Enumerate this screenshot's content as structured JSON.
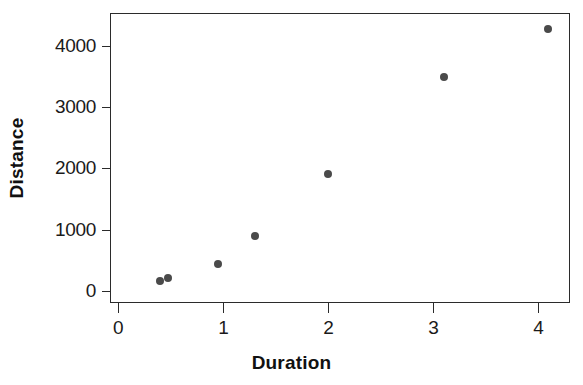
{
  "chart_data": {
    "type": "scatter",
    "title": "",
    "subtitle": "",
    "xlabel": "Duration",
    "ylabel": "Distance",
    "xlim": [
      -0.08,
      4.3
    ],
    "ylim": [
      -190,
      4530
    ],
    "xticks": [
      0,
      1,
      2,
      3,
      4
    ],
    "xticklabels": [
      "0",
      "1",
      "2",
      "3",
      "4"
    ],
    "yticks": [
      0,
      1000,
      2000,
      3000,
      4000
    ],
    "yticklabels": [
      "0",
      "1000",
      "2000",
      "3000",
      "4000"
    ],
    "grid": false,
    "legend": null,
    "legend_position": "none",
    "marker": "circle",
    "marker_color": "#4a4a4a",
    "marker_size": 8,
    "frame_color": "#2b2b2b",
    "background_color": "#ffffff",
    "series": [
      {
        "name": "observations",
        "x": [
          0.39,
          0.46,
          0.94,
          1.29,
          1.99,
          3.09,
          4.08
        ],
        "y": [
          190,
          240,
          465,
          910,
          1920,
          3500,
          4285
        ],
        "points": [
          {
            "x": 0.39,
            "y": 190
          },
          {
            "x": 0.46,
            "y": 240
          },
          {
            "x": 0.94,
            "y": 465
          },
          {
            "x": 1.29,
            "y": 910
          },
          {
            "x": 1.99,
            "y": 1920
          },
          {
            "x": 3.09,
            "y": 3500
          },
          {
            "x": 4.08,
            "y": 4285
          }
        ]
      }
    ],
    "annotations": []
  }
}
